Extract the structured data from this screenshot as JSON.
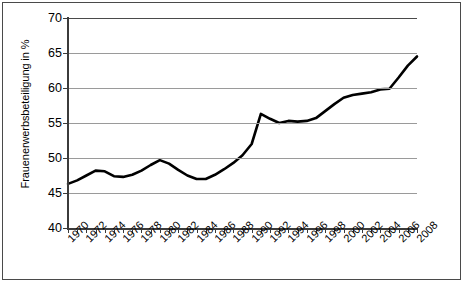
{
  "chart_data": {
    "type": "line",
    "title": "",
    "xlabel": "",
    "ylabel": "Frauenerwerbsbeteiligung in %",
    "ylim": [
      40,
      70
    ],
    "xlim": [
      1970,
      2008
    ],
    "ytick_labels": [
      "70",
      "65",
      "60",
      "55",
      "50",
      "45",
      "40"
    ],
    "ytick_values": [
      70,
      65,
      60,
      55,
      50,
      45,
      40
    ],
    "xtick_labels": [
      "1970",
      "1972",
      "1974",
      "1976",
      "1978",
      "1980",
      "1982",
      "1984",
      "1986",
      "1988",
      "1990",
      "1992",
      "1994",
      "1996",
      "1998",
      "2000",
      "2002",
      "2004",
      "2006",
      "2008"
    ],
    "grid": "horizontal",
    "legend": "none",
    "line_color": "#000000",
    "x": [
      1970,
      1971,
      1972,
      1973,
      1974,
      1975,
      1976,
      1977,
      1978,
      1979,
      1980,
      1981,
      1982,
      1983,
      1984,
      1985,
      1986,
      1987,
      1988,
      1989,
      1990,
      1991,
      1992,
      1993,
      1994,
      1995,
      1996,
      1997,
      1998,
      1999,
      2000,
      2001,
      2002,
      2003,
      2004,
      2005,
      2006,
      2007,
      2008
    ],
    "values": [
      46.3,
      46.8,
      47.5,
      48.2,
      48.1,
      47.4,
      47.3,
      47.6,
      48.2,
      49.0,
      49.7,
      49.2,
      48.3,
      47.5,
      47.0,
      47.0,
      47.6,
      48.4,
      49.3,
      50.4,
      52.0,
      56.3,
      55.6,
      55.0,
      55.3,
      55.2,
      55.3,
      55.7,
      56.7,
      57.7,
      58.6,
      59.0,
      59.2,
      59.4,
      59.8,
      59.9,
      61.5,
      63.2,
      64.5
    ],
    "series": [
      {
        "name": "Frauenerwerbsbeteiligung",
        "values": [
          46.3,
          46.8,
          47.5,
          48.2,
          48.1,
          47.4,
          47.3,
          47.6,
          48.2,
          49.0,
          49.7,
          49.2,
          48.3,
          47.5,
          47.0,
          47.0,
          47.6,
          48.4,
          49.3,
          50.4,
          52.0,
          56.3,
          55.6,
          55.0,
          55.3,
          55.2,
          55.3,
          55.7,
          56.7,
          57.7,
          58.6,
          59.0,
          59.2,
          59.4,
          59.8,
          59.9,
          61.5,
          63.2,
          64.5
        ]
      }
    ]
  }
}
